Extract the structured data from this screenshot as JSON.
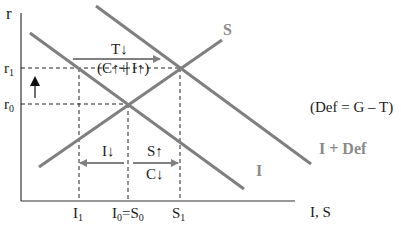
{
  "colors": {
    "curve": "#7f7f7f",
    "curve_label": "#8a8a8a",
    "axis": "#333333",
    "text": "#1a1a1a",
    "guide": "#222222",
    "arrow_gray": "#808080",
    "arrow_black": "#111111"
  },
  "axes": {
    "y_label": "r",
    "x_label": "I, S"
  },
  "y_ticks": [
    {
      "main": "r",
      "sub": "1",
      "name": "r1"
    },
    {
      "main": "r",
      "sub": "0",
      "name": "r0"
    }
  ],
  "x_ticks": [
    {
      "text": "I",
      "sub": "1",
      "name": "I1"
    },
    {
      "text": "I",
      "sub": "0",
      "rest": "=S",
      "sub2": "0",
      "name": "I0=S0"
    },
    {
      "text": "S",
      "sub": "1",
      "name": "S1"
    }
  ],
  "curves": {
    "saving": "S",
    "investment": "I",
    "investment_plus_deficit": "I + Def"
  },
  "annotations": {
    "deficit_definition": "(Def = G – T)",
    "tax_cut": "T↓",
    "consumption_investment_up": "(C↑+ I↑)",
    "investment_down": "I↓",
    "saving_up": "S↑",
    "consumption_down": "C↓"
  }
}
